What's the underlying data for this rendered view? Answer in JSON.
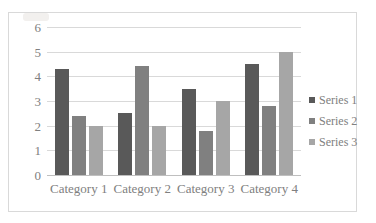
{
  "chart_data": {
    "type": "bar",
    "title": "",
    "subtitle": "",
    "xlabel": "",
    "ylabel": "",
    "categories": [
      "Category 1",
      "Category 2",
      "Category 3",
      "Category 4"
    ],
    "series": [
      {
        "name": "Series 1",
        "color": "#595959",
        "values": [
          4.3,
          2.5,
          3.5,
          4.5
        ]
      },
      {
        "name": "Series 2",
        "color": "#808080",
        "values": [
          2.4,
          4.4,
          1.8,
          2.8
        ]
      },
      {
        "name": "Series 3",
        "color": "#a6a6a6",
        "values": [
          2.0,
          2.0,
          3.0,
          5.0
        ]
      }
    ],
    "ylim": [
      0,
      6
    ],
    "yticks": [
      "0",
      "1",
      "2",
      "3",
      "4",
      "5",
      "6"
    ],
    "ytick_values": [
      0,
      1,
      2,
      3,
      4,
      5,
      6
    ],
    "grid": true,
    "grid_axis": "y",
    "legend_position": "right",
    "legend_entries": [
      "Series 1",
      "Series 2",
      "Series 3"
    ],
    "annotations": []
  },
  "style": {
    "plot_background": "#ffffff",
    "frame_border_color": "#d9d9d9",
    "gridline_color": "#d9d9d9",
    "axis_color": "#bfbfbf",
    "tick_text_color": "#808080"
  }
}
